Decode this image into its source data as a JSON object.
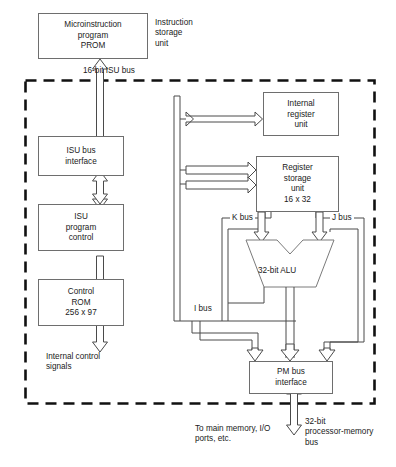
{
  "diagram": {
    "boundary_style": "dashed",
    "blocks": {
      "prom": "Microinstruction\nprogram\nPROM",
      "isu_bus_interface": "ISU bus\ninterface",
      "isu_program_control": "ISU\nprogram\ncontrol",
      "control_rom": "Control\nROM\n256 x 97",
      "internal_register_unit": "Internal\nregister\nunit",
      "register_storage_unit": "Register\nstorage\nunit\n16 x 32",
      "alu": "32-bit ALU",
      "pm_bus_interface": "PM bus\ninterface"
    },
    "labels": {
      "instruction_storage_unit": "Instruction\nstorage\nunit",
      "isu_bus": "16-bit ISU bus",
      "internal_control_signals": "Internal control\nsignals",
      "k_bus": "K bus",
      "j_bus": "J bus",
      "i_bus": "I bus",
      "to_main_memory": "To main memory, I/O\nports, etc.",
      "processor_memory_bus": "32-bit\nprocessor-memory\nbus"
    },
    "colors": {
      "line": "#4a4a4a",
      "block_border": "#6e6e6e",
      "boundary": "#111111",
      "text": "#1a1a1a",
      "background": "#ffffff"
    }
  }
}
